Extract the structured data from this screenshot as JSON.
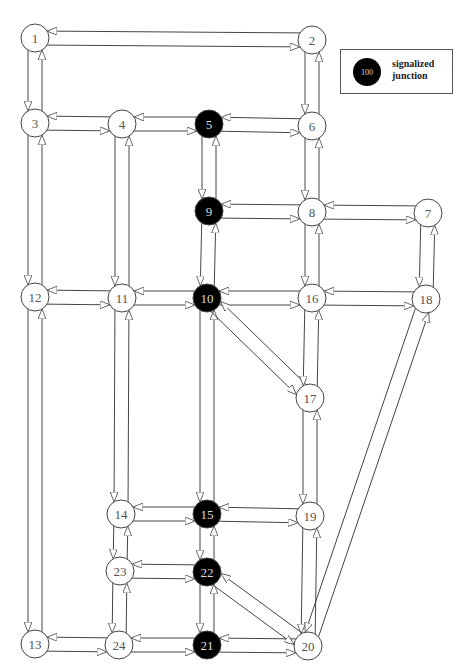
{
  "legend": {
    "symbol_label": "100",
    "text_line1": "signalized",
    "text_line2": "junction"
  },
  "colors": {
    "signalized_fill": "#000000",
    "signalized_text": "#dddddd",
    "normal_fill": "#ffffff",
    "normal_text": "#555555",
    "stroke": "#444444"
  },
  "nodes": [
    {
      "id": "1",
      "x": 35,
      "y": 38,
      "signalized": false
    },
    {
      "id": "2",
      "x": 312,
      "y": 40,
      "signalized": false
    },
    {
      "id": "3",
      "x": 35,
      "y": 123,
      "signalized": false
    },
    {
      "id": "4",
      "x": 122,
      "y": 124,
      "signalized": false
    },
    {
      "id": "5",
      "x": 209,
      "y": 124,
      "signalized": true
    },
    {
      "id": "6",
      "x": 312,
      "y": 126,
      "signalized": false
    },
    {
      "id": "7",
      "x": 428,
      "y": 213,
      "signalized": false
    },
    {
      "id": "8",
      "x": 312,
      "y": 212,
      "signalized": false
    },
    {
      "id": "9",
      "x": 209,
      "y": 211,
      "signalized": true
    },
    {
      "id": "10",
      "x": 207,
      "y": 298,
      "signalized": true
    },
    {
      "id": "11",
      "x": 122,
      "y": 298,
      "signalized": false
    },
    {
      "id": "12",
      "x": 35,
      "y": 297,
      "signalized": false
    },
    {
      "id": "13",
      "x": 35,
      "y": 644,
      "signalized": false
    },
    {
      "id": "14",
      "x": 121,
      "y": 514,
      "signalized": false
    },
    {
      "id": "15",
      "x": 207,
      "y": 514,
      "signalized": true
    },
    {
      "id": "16",
      "x": 312,
      "y": 298,
      "signalized": false
    },
    {
      "id": "17",
      "x": 310,
      "y": 398,
      "signalized": false
    },
    {
      "id": "18",
      "x": 426,
      "y": 299,
      "signalized": false
    },
    {
      "id": "19",
      "x": 310,
      "y": 516,
      "signalized": false
    },
    {
      "id": "20",
      "x": 308,
      "y": 646,
      "signalized": false
    },
    {
      "id": "21",
      "x": 207,
      "y": 645,
      "signalized": true
    },
    {
      "id": "22",
      "x": 207,
      "y": 572,
      "signalized": true
    },
    {
      "id": "23",
      "x": 120,
      "y": 571,
      "signalized": false
    },
    {
      "id": "24",
      "x": 119,
      "y": 645,
      "signalized": false
    }
  ],
  "links": [
    [
      "1",
      "2"
    ],
    [
      "1",
      "3"
    ],
    [
      "2",
      "6"
    ],
    [
      "3",
      "4"
    ],
    [
      "3",
      "12"
    ],
    [
      "4",
      "5"
    ],
    [
      "4",
      "11"
    ],
    [
      "5",
      "6"
    ],
    [
      "5",
      "9"
    ],
    [
      "6",
      "8"
    ],
    [
      "7",
      "8"
    ],
    [
      "7",
      "18"
    ],
    [
      "8",
      "9"
    ],
    [
      "8",
      "16"
    ],
    [
      "9",
      "10"
    ],
    [
      "10",
      "11"
    ],
    [
      "10",
      "16"
    ],
    [
      "10",
      "15"
    ],
    [
      "10",
      "17"
    ],
    [
      "11",
      "12"
    ],
    [
      "11",
      "14"
    ],
    [
      "12",
      "13"
    ],
    [
      "13",
      "24"
    ],
    [
      "14",
      "15"
    ],
    [
      "14",
      "23"
    ],
    [
      "15",
      "19"
    ],
    [
      "15",
      "22"
    ],
    [
      "16",
      "18"
    ],
    [
      "16",
      "17"
    ],
    [
      "17",
      "19"
    ],
    [
      "18",
      "20"
    ],
    [
      "19",
      "20"
    ],
    [
      "20",
      "21"
    ],
    [
      "20",
      "22"
    ],
    [
      "21",
      "22"
    ],
    [
      "21",
      "24"
    ],
    [
      "22",
      "23"
    ],
    [
      "23",
      "24"
    ]
  ]
}
